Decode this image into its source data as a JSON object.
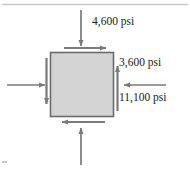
{
  "figure": {
    "name": "stress-element-diagram",
    "colors": {
      "element_fill": "#d4d4d4",
      "element_stroke": "#6b6b6b",
      "arrow": "#7a7a7a",
      "text": "#1a1a1a",
      "rule": "#c9c9c9"
    },
    "element": {
      "shape": "square",
      "x": 50,
      "y": 52,
      "width": 64,
      "height": 65
    },
    "labels": {
      "top_normal": "4,600 psi",
      "right_shear": "3,600 psi",
      "right_normal": "11,100 psi"
    },
    "arrows": [
      {
        "name": "top-normal-arrow",
        "direction": "down",
        "type": "normal",
        "label": "4,600 psi"
      },
      {
        "name": "bottom-normal-arrow",
        "direction": "up",
        "type": "normal",
        "label": ""
      },
      {
        "name": "left-normal-arrow",
        "direction": "right",
        "type": "normal",
        "label": ""
      },
      {
        "name": "right-normal-arrow",
        "direction": "left",
        "type": "normal",
        "label": "11,100 psi"
      },
      {
        "name": "top-shear-arrow",
        "direction": "right",
        "type": "shear",
        "label": ""
      },
      {
        "name": "bottom-shear-arrow",
        "direction": "left",
        "type": "shear",
        "label": ""
      },
      {
        "name": "left-shear-arrow",
        "direction": "down",
        "type": "shear",
        "label": ""
      },
      {
        "name": "right-shear-arrow",
        "direction": "up",
        "type": "shear",
        "label": "3,600 psi"
      }
    ]
  }
}
